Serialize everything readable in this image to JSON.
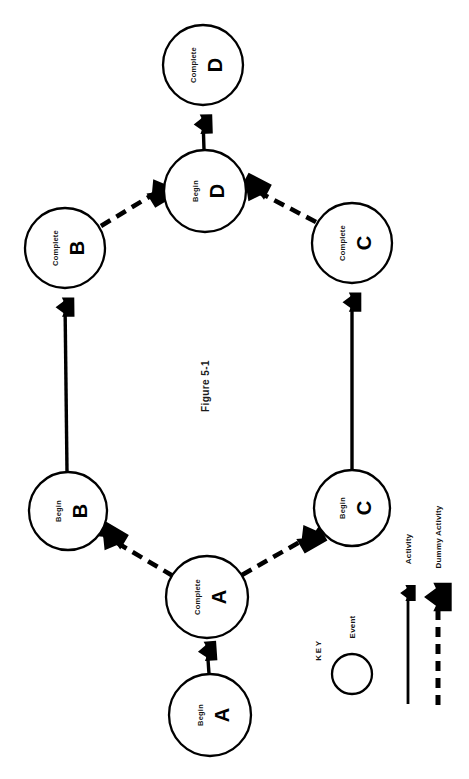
{
  "figure": {
    "caption": "Figure 5-1",
    "orientation_deg": -90,
    "background": "#ffffff",
    "ink": "#000000"
  },
  "nodes": [
    {
      "id": "complete-d",
      "sub": "Complete",
      "label": "D",
      "cx": 203,
      "cy": 65,
      "r": 40
    },
    {
      "id": "begin-d",
      "sub": "Begin",
      "label": "D",
      "cx": 205,
      "cy": 191,
      "r": 41
    },
    {
      "id": "complete-b",
      "sub": "Complete",
      "label": "B",
      "cx": 65,
      "cy": 248,
      "r": 40
    },
    {
      "id": "complete-c",
      "sub": "Complete",
      "label": "C",
      "cx": 352,
      "cy": 243,
      "r": 40
    },
    {
      "id": "begin-b",
      "sub": "Begin",
      "label": "B",
      "cx": 68,
      "cy": 511,
      "r": 39
    },
    {
      "id": "begin-c",
      "sub": "Begin",
      "label": "C",
      "cx": 352,
      "cy": 508,
      "r": 38
    },
    {
      "id": "complete-a",
      "sub": "Complete",
      "label": "A",
      "cx": 207,
      "cy": 597,
      "r": 41
    },
    {
      "id": "begin-a",
      "sub": "Begin",
      "label": "A",
      "cx": 210,
      "cy": 715,
      "r": 41
    }
  ],
  "edges": [
    {
      "id": "edge-begin-a-to-complete-a",
      "from": "begin-a",
      "to": "complete-a",
      "kind": "activity"
    },
    {
      "id": "edge-complete-a-to-begin-b",
      "from": "complete-a",
      "to": "begin-b",
      "kind": "dummy"
    },
    {
      "id": "edge-complete-a-to-begin-c",
      "from": "complete-a",
      "to": "begin-c",
      "kind": "dummy"
    },
    {
      "id": "edge-begin-b-to-complete-b",
      "from": "begin-b",
      "to": "complete-b",
      "kind": "activity"
    },
    {
      "id": "edge-begin-c-to-complete-c",
      "from": "begin-c",
      "to": "complete-c",
      "kind": "activity"
    },
    {
      "id": "edge-complete-b-to-begin-d",
      "from": "complete-b",
      "to": "begin-d",
      "kind": "dummy"
    },
    {
      "id": "edge-complete-c-to-begin-d",
      "from": "complete-c",
      "to": "begin-d",
      "kind": "dummy"
    },
    {
      "id": "edge-begin-d-to-complete-d",
      "from": "begin-d",
      "to": "complete-d",
      "kind": "activity"
    }
  ],
  "key": {
    "title": "KEY",
    "items": [
      {
        "id": "key-event",
        "label": "Event",
        "symbol": "circle"
      },
      {
        "id": "key-activity",
        "label": "Activity",
        "symbol": "solid-arrow"
      },
      {
        "id": "key-dummy",
        "label": "Dummy Activity",
        "symbol": "dashed-arrow"
      }
    ]
  }
}
